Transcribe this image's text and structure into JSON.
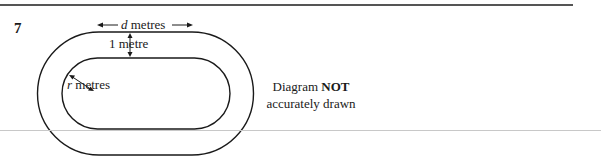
{
  "question": {
    "number": "7"
  },
  "diagram": {
    "labels": {
      "d_var": "d",
      "d_unit": " metres",
      "width": "1 metre",
      "r_var": "r",
      "r_unit": " metres"
    },
    "note": {
      "line1_prefix": "Diagram ",
      "line1_bold": "NOT",
      "line2": "accurately drawn"
    }
  }
}
